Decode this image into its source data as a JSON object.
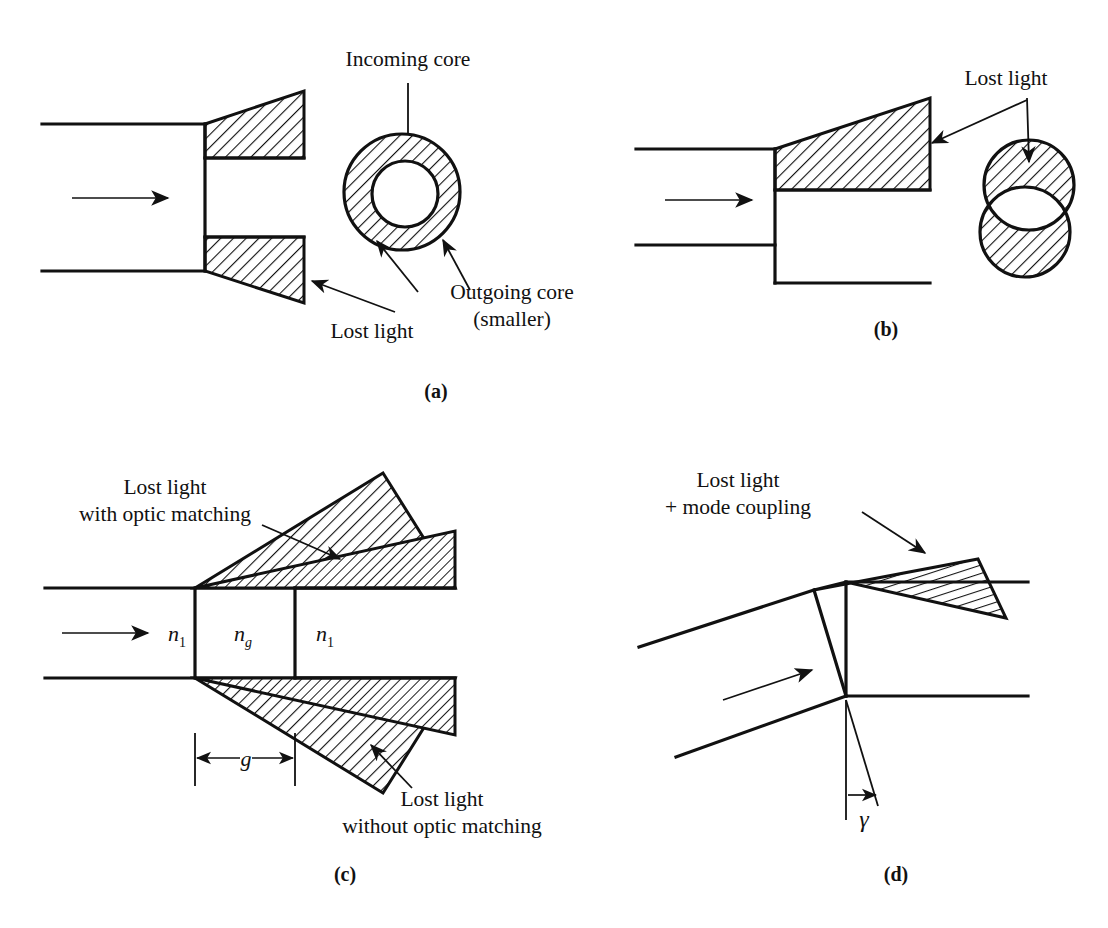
{
  "figure": {
    "ink_color": "#111111",
    "background_color": "#ffffff"
  },
  "panels": [
    {
      "id": "a",
      "id_label": "(a)",
      "description": "Core diameter mismatch at a fiber joint",
      "labels": {
        "incoming_core": "Incoming core",
        "outgoing_core_line1": "Outgoing core",
        "outgoing_core_line2": "(smaller)",
        "lost_light": "Lost light"
      }
    },
    {
      "id": "b",
      "id_label": "(b)",
      "description": "Lateral (axial) offset of fiber cores",
      "labels": {
        "lost_light": "Lost light"
      }
    },
    {
      "id": "c",
      "id_label": "(c)",
      "description": "End separation gap with and without index matching",
      "labels": {
        "lost_with_line1": "Lost light",
        "lost_with_line2": "with optic matching",
        "lost_without_line1": "Lost light",
        "lost_without_line2": "without optic matching",
        "n_core_left": "n",
        "n_core_left_sub": "1",
        "n_gap": "n",
        "n_gap_sub": "g",
        "n_core_right": "n",
        "n_core_right_sub": "1",
        "gap_dimension": "g"
      }
    },
    {
      "id": "d",
      "id_label": "(d)",
      "description": "Angular misalignment of fiber axes",
      "labels": {
        "lost_line1": "Lost light",
        "lost_line2": "+ mode coupling",
        "angle_symbol": "γ"
      }
    }
  ]
}
